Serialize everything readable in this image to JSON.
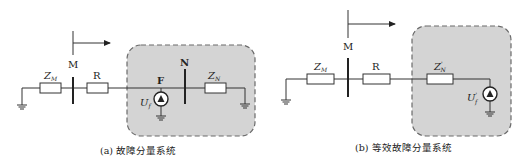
{
  "figure_a": {
    "caption": "(a) 故障分量系统",
    "labels": {
      "zm": "Z",
      "zm_sub": "M",
      "m": "M",
      "r": "R",
      "f": "F",
      "n": "N",
      "zn": "Z",
      "zn_sub": "N",
      "uf": "U",
      "uf_sub": "f"
    }
  },
  "figure_b": {
    "caption": "(b) 等效故障分量系统",
    "labels": {
      "zm": "Z",
      "zm_sub": "M",
      "m": "M",
      "r": "R",
      "zn": "Z",
      "zn_sup": "'",
      "zn_sub": "N",
      "uf": "U",
      "uf_sup": "'",
      "uf_sub": "f"
    }
  },
  "colors": {
    "region_fill": "#d4d4d4",
    "region_border": "#6a6a6a",
    "line": "#333333"
  }
}
